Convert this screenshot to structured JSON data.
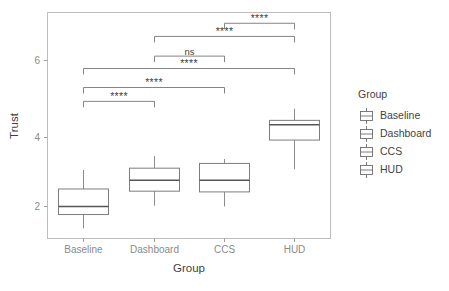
{
  "chart_data": {
    "type": "box",
    "title": "",
    "xlabel": "Group",
    "ylabel": "Trust",
    "categories": [
      "Baseline",
      "Dashboard",
      "CCS",
      "HUD"
    ],
    "ylim": [
      1.15,
      7.1
    ],
    "yticks": [
      2,
      4,
      6
    ],
    "ytick_labels": [
      "2",
      "4",
      "6"
    ],
    "grid": false,
    "legend": {
      "title": "Group",
      "position": "right",
      "entries": [
        "Baseline",
        "Dashboard",
        "CCS",
        "HUD"
      ]
    },
    "boxes": [
      {
        "group": "Baseline",
        "whisker_low": 1.4,
        "q1": 1.78,
        "median": 2.0,
        "q3": 2.48,
        "whisker_high": 3.0
      },
      {
        "group": "Dashboard",
        "whisker_low": 2.02,
        "q1": 2.42,
        "median": 2.72,
        "q3": 3.05,
        "whisker_high": 3.38
      },
      {
        "group": "CCS",
        "whisker_low": 2.0,
        "q1": 2.4,
        "median": 2.72,
        "q3": 3.18,
        "whisker_high": 3.3
      },
      {
        "group": "HUD",
        "whisker_low": 3.02,
        "q1": 3.82,
        "median": 4.24,
        "q3": 4.36,
        "whisker_high": 4.68
      }
    ],
    "annotations": [
      {
        "group1": "Baseline",
        "group2": "Dashboard",
        "label": "****",
        "y": 4.88
      },
      {
        "group1": "Baseline",
        "group2": "CCS",
        "label": "****",
        "y": 5.26
      },
      {
        "group1": "Baseline",
        "group2": "HUD",
        "label": "****",
        "y": 5.78
      },
      {
        "group1": "Dashboard",
        "group2": "CCS",
        "label": "ns",
        "y": 6.12
      },
      {
        "group1": "Dashboard",
        "group2": "HUD",
        "label": "****",
        "y": 6.66
      },
      {
        "group1": "CCS",
        "group2": "HUD",
        "label": "****",
        "y": 7.02
      }
    ]
  }
}
